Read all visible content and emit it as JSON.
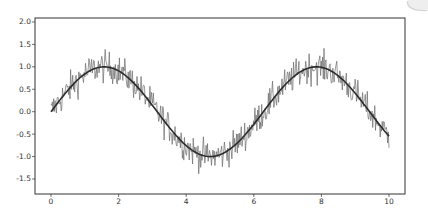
{
  "chart_data": {
    "type": "line",
    "title": "",
    "xlabel": "",
    "ylabel": "",
    "xlim": [
      -0.5,
      10.5
    ],
    "ylim": [
      -1.75,
      2.05
    ],
    "grid": false,
    "legend": null,
    "xticks": [
      0,
      2,
      4,
      6,
      8,
      10
    ],
    "xtick_labels": [
      "0",
      "2",
      "4",
      "6",
      "8",
      "10"
    ],
    "yticks": [
      2.0,
      1.5,
      1.0,
      0.5,
      0.0,
      -0.5,
      -1.0,
      -1.5
    ],
    "ytick_labels": [
      "2.0",
      "1.5",
      "1.0",
      "0.5",
      "0.0",
      "-0.5",
      "-1.0",
      "-1.5"
    ],
    "series": [
      {
        "name": "noisy signal",
        "style": "thin grey line",
        "color": "#6b6b6b",
        "description": "sin(x) plus random noise, ~500 samples from x=0 to x=10",
        "x_range": [
          0,
          10
        ],
        "n_points": 500,
        "noise_amplitude": 0.35,
        "observed_max": 1.85,
        "observed_min": -1.6
      },
      {
        "name": "sin(x)",
        "style": "smooth dark line",
        "color": "#2b2b2b",
        "x": [
          0,
          0.5,
          1,
          1.5,
          1.57,
          2,
          2.5,
          3,
          3.5,
          4,
          4.5,
          4.71,
          5,
          5.5,
          6,
          6.5,
          7,
          7.5,
          7.85,
          8,
          8.5,
          9,
          9.5,
          10
        ],
        "values": [
          0.0,
          0.48,
          0.84,
          1.0,
          1.0,
          0.91,
          0.6,
          0.14,
          -0.35,
          -0.76,
          -0.98,
          -1.0,
          -0.96,
          -0.71,
          -0.28,
          0.22,
          0.66,
          0.94,
          1.0,
          0.99,
          0.8,
          0.41,
          -0.08,
          -0.54
        ]
      }
    ]
  },
  "colors": {
    "background": "#ffffff",
    "axis": "#333333",
    "noisy_line": "#6b6b6b",
    "smooth_line": "#2b2b2b"
  }
}
